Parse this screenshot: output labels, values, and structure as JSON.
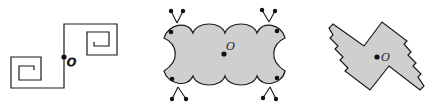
{
  "figures": [
    {
      "id": "spiral-path",
      "description": "Open path of two square spirals joined through center point O",
      "center_label": "O",
      "stroke_color": "#1a1a1a",
      "fill_color": "none"
    },
    {
      "id": "lobed-shape",
      "description": "Gray shaded shape of four bumps with concave sides and antennae at corners",
      "center_label": "O",
      "stroke_color": "#1a1a1a",
      "fill_color": "#cfcfcf"
    },
    {
      "id": "staircase-shape",
      "description": "Gray shaded pinwheel polygon with staircase edges",
      "center_label": "O",
      "stroke_color": "#1a1a1a",
      "fill_color": "#cfcfcf"
    }
  ],
  "labels": {
    "fig1_center": "O",
    "fig2_center": "O",
    "fig3_center": "O"
  }
}
